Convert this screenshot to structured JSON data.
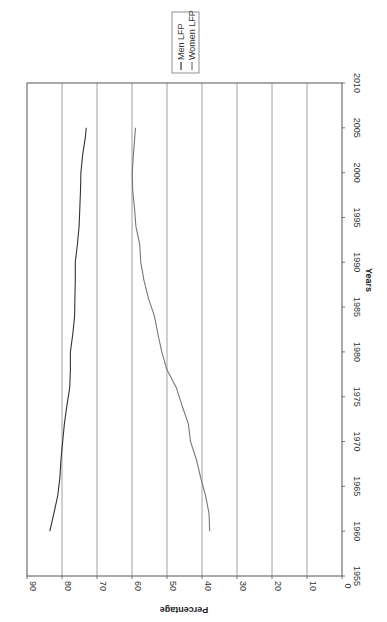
{
  "chart_data": {
    "type": "line",
    "orientation_note": "rotated 90deg clockwise on page",
    "title": "",
    "xlabel": "Years",
    "ylabel": "Percentage",
    "xlim": [
      1955,
      2010
    ],
    "ylim": [
      0,
      90
    ],
    "x_ticks": [
      1955,
      1960,
      1965,
      1970,
      1975,
      1980,
      1985,
      1990,
      1995,
      2000,
      2005,
      2010
    ],
    "y_ticks": [
      0,
      10,
      20,
      30,
      40,
      50,
      60,
      70,
      80,
      90
    ],
    "grid": "horizontal gridlines at each 10%",
    "legend_position": "top-right (outside plot)",
    "series": [
      {
        "name": "Men LFP",
        "color": "#333333",
        "x": [
          1960,
          1962,
          1964,
          1966,
          1968,
          1970,
          1972,
          1974,
          1976,
          1978,
          1980,
          1982,
          1984,
          1986,
          1988,
          1990,
          1992,
          1994,
          1996,
          1998,
          2000,
          2002,
          2004,
          2005
        ],
        "values": [
          83.5,
          82.3,
          81.2,
          80.6,
          80.3,
          79.8,
          79.3,
          78.6,
          77.8,
          77.6,
          77.6,
          76.9,
          76.4,
          76.3,
          76.2,
          76.2,
          75.6,
          75.1,
          74.9,
          74.7,
          74.6,
          74.1,
          73.3,
          73.1
        ]
      },
      {
        "name": "Women LFP",
        "color": "#777777",
        "x": [
          1960,
          1962,
          1964,
          1966,
          1968,
          1970,
          1972,
          1974,
          1976,
          1978,
          1980,
          1982,
          1984,
          1986,
          1988,
          1990,
          1992,
          1994,
          1996,
          1998,
          2000,
          2002,
          2004,
          2005
        ],
        "values": [
          37.8,
          38.0,
          39.0,
          40.4,
          41.6,
          43.3,
          43.9,
          45.7,
          47.3,
          50.0,
          51.5,
          52.6,
          53.6,
          55.3,
          56.6,
          57.5,
          57.8,
          58.9,
          59.3,
          59.8,
          59.9,
          59.6,
          59.2,
          59.0
        ]
      }
    ]
  },
  "legend": {
    "items": [
      {
        "label": "Men LFP",
        "color": "#333333"
      },
      {
        "label": "Women LFP",
        "color": "#777777"
      }
    ]
  },
  "axes": {
    "x_title": "Years",
    "y_title": "Percentage"
  }
}
